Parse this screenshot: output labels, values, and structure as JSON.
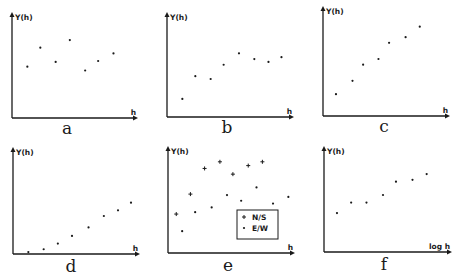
{
  "chart_data": [
    {
      "id": "a",
      "type": "scatter",
      "panel_label": "a",
      "ylabel": "Y(h)",
      "xlabel": "h",
      "xlim": [
        0,
        10
      ],
      "ylim": [
        0,
        10
      ],
      "series": [
        {
          "name": "points",
          "marker": "dot",
          "x": [
            1.3,
            2.4,
            3.7,
            4.9,
            6.2,
            7.3,
            8.6
          ],
          "y": [
            5.4,
            7.4,
            5.9,
            8.2,
            5.0,
            6.0,
            6.8
          ]
        }
      ]
    },
    {
      "id": "b",
      "type": "scatter",
      "panel_label": "b",
      "ylabel": "Y(h)",
      "xlabel": "h",
      "xlim": [
        0,
        10
      ],
      "ylim": [
        0,
        10
      ],
      "series": [
        {
          "name": "points",
          "marker": "dot",
          "x": [
            1.3,
            2.4,
            3.7,
            4.8,
            6.1,
            7.4,
            8.6,
            9.7
          ],
          "y": [
            1.9,
            4.3,
            4.0,
            5.5,
            6.7,
            6.1,
            5.8,
            6.3
          ]
        }
      ]
    },
    {
      "id": "c",
      "type": "scatter",
      "panel_label": "c",
      "ylabel": "Y(h)",
      "xlabel": "h",
      "xlim": [
        0,
        10
      ],
      "ylim": [
        0,
        10
      ],
      "series": [
        {
          "name": "points",
          "marker": "dot",
          "x": [
            1.1,
            2.5,
            3.4,
            4.7,
            5.6,
            7.0,
            8.2
          ],
          "y": [
            2.3,
            3.7,
            5.4,
            6.0,
            7.7,
            8.3,
            9.4
          ]
        }
      ]
    },
    {
      "id": "d",
      "type": "scatter",
      "panel_label": "d",
      "ylabel": "Y(h)",
      "xlabel": "h",
      "xlim": [
        0,
        10
      ],
      "ylim": [
        0,
        10
      ],
      "series": [
        {
          "name": "points",
          "marker": "dot",
          "x": [
            1.3,
            2.6,
            3.8,
            5.0,
            6.4,
            7.7,
            8.9,
            10.0
          ],
          "y": [
            0.2,
            0.5,
            1.1,
            1.9,
            2.8,
            4.0,
            4.6,
            5.4
          ]
        }
      ]
    },
    {
      "id": "e",
      "type": "scatter",
      "panel_label": "e",
      "ylabel": "Y(h)",
      "xlabel": "h",
      "xlim": [
        0,
        10
      ],
      "ylim": [
        0,
        10
      ],
      "legend": {
        "position": "bottom-right",
        "entries": [
          "N/S",
          "E/W"
        ]
      },
      "series": [
        {
          "name": "N/S",
          "marker": "plus",
          "x": [
            0.7,
            1.9,
            3.1,
            4.4,
            5.5,
            6.8,
            8.0
          ],
          "y": [
            4.1,
            6.2,
            8.9,
            9.6,
            8.3,
            9.2,
            9.6
          ]
        },
        {
          "name": "E/W",
          "marker": "dot",
          "x": [
            1.2,
            2.3,
            3.7,
            5.0,
            6.2,
            7.5,
            8.9,
            10.2
          ],
          "y": [
            2.3,
            4.3,
            4.8,
            6.1,
            5.5,
            6.9,
            5.2,
            5.9
          ]
        }
      ]
    },
    {
      "id": "f",
      "type": "scatter",
      "panel_label": "f",
      "ylabel": "Y(h)",
      "xlabel": "log h",
      "xlim": [
        0,
        10
      ],
      "ylim": [
        0,
        10
      ],
      "series": [
        {
          "name": "points",
          "marker": "dot",
          "x": [
            1.1,
            2.3,
            3.6,
            5.0,
            6.1,
            7.5,
            8.7
          ],
          "y": [
            4.1,
            5.2,
            5.2,
            6.0,
            7.4,
            7.6,
            8.2
          ]
        }
      ]
    }
  ]
}
